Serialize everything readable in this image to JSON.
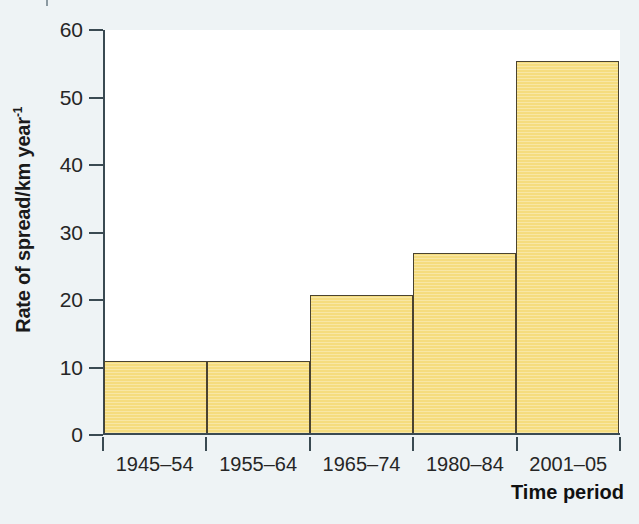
{
  "chart_data": {
    "type": "bar",
    "title": "",
    "subtitle": "",
    "xlabel": "Time period",
    "ylabel": "Rate of spread/km year",
    "ylabel_exponent": "-1",
    "ylabel_full": "Rate of spread/km year-1",
    "categories": [
      "1945–54",
      "1955–64",
      "1965–74",
      "1980–84",
      "2001–05"
    ],
    "values": [
      10.7,
      10.7,
      20.5,
      26.7,
      55.1
    ],
    "ylim": [
      0,
      60
    ],
    "yticks": [
      0,
      10,
      20,
      30,
      40,
      50,
      60
    ],
    "ytick_labels": [
      "0",
      "10",
      "20",
      "30",
      "40",
      "50",
      "60"
    ],
    "xlim_categories": 5,
    "grid": false,
    "legend": null,
    "legend_position": "none",
    "bar_fill_color": "#f5dc7e",
    "bar_edge_color": "#4a4330",
    "axis_color": "#3a4a52",
    "plot_background": "#ffffff",
    "figure_background": "#eef3f5",
    "annotations": []
  },
  "axes": {
    "y_title_main": "Rate of spread/km year",
    "y_title_sup": "-1",
    "x_title": "Time period"
  }
}
